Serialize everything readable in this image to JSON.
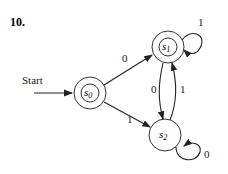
{
  "problem_number": "10.",
  "start_label": "Start",
  "states": [
    {
      "id": "s0",
      "name": "s",
      "sub": "0",
      "accepting": true,
      "start": true
    },
    {
      "id": "s1",
      "name": "s",
      "sub": "1",
      "accepting": true,
      "start": false
    },
    {
      "id": "s2",
      "name": "s",
      "sub": "2",
      "accepting": false,
      "start": false
    }
  ],
  "transitions": [
    {
      "from": "s0",
      "to": "s1",
      "label": "0"
    },
    {
      "from": "s0",
      "to": "s2",
      "label": "1"
    },
    {
      "from": "s1",
      "to": "s1",
      "label": "1"
    },
    {
      "from": "s1",
      "to": "s2",
      "label": "0"
    },
    {
      "from": "s2",
      "to": "s1",
      "label": "1"
    },
    {
      "from": "s2",
      "to": "s2",
      "label": "0"
    }
  ]
}
